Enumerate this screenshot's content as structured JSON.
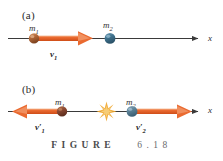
{
  "figure": {
    "caption_word": "FIGURE",
    "caption_number": "6.18",
    "panels": [
      {
        "id": "a",
        "label": "(a)",
        "axis_label": "x",
        "masses": [
          {
            "name": "m1",
            "label_html": "m",
            "subscript": "1",
            "color": "#a85a2e"
          },
          {
            "name": "m2",
            "label_html": "m",
            "subscript": "2",
            "color": "#41718f"
          }
        ],
        "vectors": [
          {
            "name": "v1",
            "label_html": "v",
            "subscript": "1",
            "prime": "",
            "direction": "right",
            "color": "#e8612c"
          }
        ]
      },
      {
        "id": "b",
        "label": "(b)",
        "axis_label": "x",
        "masses": [
          {
            "name": "m1",
            "label_html": "m",
            "subscript": "1",
            "color": "#8d4a33"
          },
          {
            "name": "m2",
            "label_html": "m",
            "subscript": "2",
            "color": "#5a8099"
          }
        ],
        "vectors": [
          {
            "name": "v1-prime",
            "label_html": "v",
            "subscript": "1",
            "prime": "′",
            "direction": "left",
            "color": "#e8612c"
          },
          {
            "name": "v2-prime",
            "label_html": "v",
            "subscript": "2",
            "prime": "′",
            "direction": "right",
            "color": "#e8612c"
          }
        ],
        "collision_marker": "starburst"
      }
    ],
    "colors": {
      "axis": "#3a3a3a",
      "arrow": "#e8612c",
      "arrow_inner": "#f2a06a",
      "mass1": "#a85a2e",
      "mass2": "#41718f",
      "starburst": "#f0a832",
      "background": "#ffffff",
      "caption": "#58585a"
    }
  }
}
